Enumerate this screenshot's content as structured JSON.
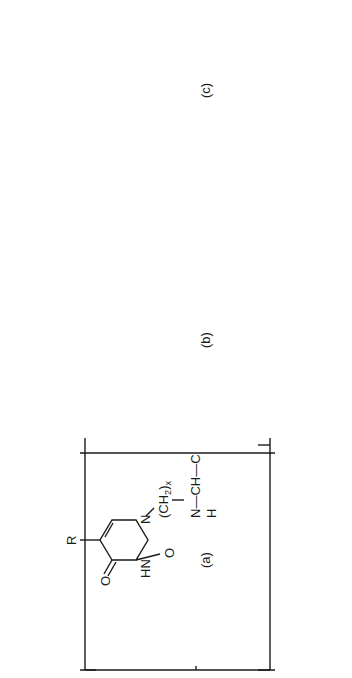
{
  "figure": {
    "orientation": "rotated 90 degrees counter-clockwise",
    "structures": [
      {
        "id": "a",
        "caption": "(a)",
        "ring_substituent": "R",
        "ring_atoms": [
          "O",
          "HN",
          "O",
          "N"
        ],
        "side_chain": "(CH2)x",
        "side_chain_subscript": "x",
        "backbone": [
          "N",
          "CH",
          "C",
          "N",
          "CH2",
          "C"
        ],
        "backbone_h": [
          "H",
          "H"
        ],
        "carbonyls": [
          "O",
          "O"
        ],
        "inner_repeat": "m",
        "outer_repeat": "n"
      },
      {
        "id": "b",
        "caption": "(b)",
        "ring_substituent": "NH2",
        "ring_atoms": [
          "N",
          "O"
        ],
        "side_chain": "CH2",
        "backbone": [
          "N",
          "CH",
          "(CH2)y",
          "C"
        ],
        "backbone_h": [
          "H"
        ],
        "carbonyls": [
          "O"
        ],
        "spacer_subscript": "y",
        "outer_repeat": "n"
      },
      {
        "id": "c",
        "caption": "(c)",
        "sugar_substituent": "B",
        "sugar_ring_atom": "O",
        "hydroxyls": [
          "OH",
          "HO"
        ],
        "linker": [
          "O",
          "C",
          "(CH2)z",
          "C",
          "NH",
          "(CH2)w"
        ],
        "linker_subscripts": [
          "z",
          "w"
        ],
        "backbone": [
          "N",
          "CH",
          "C"
        ],
        "backbone_h": [
          "H"
        ],
        "carbonyls": [
          "O",
          "O",
          "O"
        ],
        "outer_repeat": "n"
      }
    ]
  },
  "labels": {
    "R": "R",
    "O": "O",
    "HN": "HN",
    "N": "N",
    "H": "H",
    "NH": "NH",
    "NH2_main": "NH",
    "sub2": "2",
    "CH": "CH",
    "C": "C",
    "CH2_main": "CH",
    "x": "x",
    "y": "y",
    "z": "z",
    "w": "w",
    "m": "m",
    "n": "n",
    "B": "B",
    "OH": "OH",
    "HO": "HO",
    "paren_open": "(",
    "paren_close": ")",
    "cap_a": "(a)",
    "cap_b": "(b)",
    "cap_c": "(c)"
  }
}
